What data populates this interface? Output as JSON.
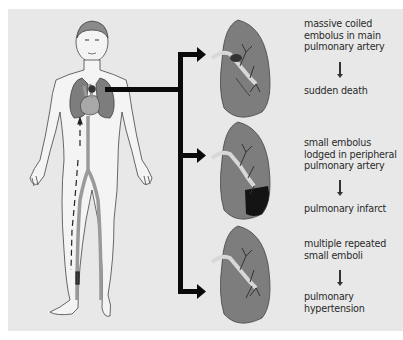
{
  "diagram": {
    "colors": {
      "background": "#e8e8e8",
      "lung_fill": "#7d7d7d",
      "lung_stroke": "#444444",
      "body_fill": "#f4f4f4",
      "vessel_fill": "#a8a8a8",
      "infarct": "#141414",
      "arrow": "#0a0a0a"
    },
    "branches": [
      {
        "cause": "massive coiled embolus in main pulmonary artery",
        "cause_lines": [
          "massive coiled",
          "embolus in main",
          "pulmonary artery"
        ],
        "outcome_lines": [
          "sudden death"
        ]
      },
      {
        "cause": "small embolus lodged in peripheral pulmonary artery",
        "cause_lines": [
          "small embolus",
          "lodged in peripheral",
          "pulmonary artery"
        ],
        "outcome_lines": [
          "pulmonary infarct"
        ]
      },
      {
        "cause": "multiple repeated small emboli",
        "cause_lines": [
          "multiple repeated",
          "small emboli"
        ],
        "outcome_lines": [
          "pulmonary",
          "hypertension"
        ]
      }
    ]
  }
}
